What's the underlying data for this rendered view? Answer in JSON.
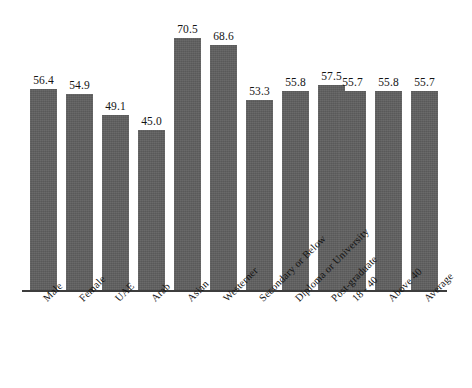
{
  "chart_data": {
    "type": "bar",
    "title": "",
    "subtitle": "",
    "xlabel": "",
    "ylabel": "",
    "ylim": [
      0,
      75
    ],
    "grid": false,
    "legend": null,
    "bar_color": "#5e5e5e",
    "background_color": "#ffffff",
    "axis_color": "#3d3d3d",
    "label_color": "#141414",
    "value_label_format": "one-decimal",
    "categories": [
      "Male",
      "Female",
      "UAE",
      "Arab",
      "Asian",
      "Westerner",
      "Secondary or Below",
      "Diploma or University",
      "Post-graduate",
      "18 - 40",
      "Above 40",
      "Average"
    ],
    "values": [
      56.4,
      54.9,
      49.1,
      45.0,
      70.5,
      68.6,
      53.3,
      55.8,
      57.5,
      55.7,
      55.8,
      55.7
    ],
    "value_labels": [
      "56.4",
      "54.9",
      "49.1",
      "45.0",
      "70.5",
      "68.6",
      "53.3",
      "55.8",
      "57.5",
      "55.7",
      "55.8",
      "55.7"
    ]
  }
}
